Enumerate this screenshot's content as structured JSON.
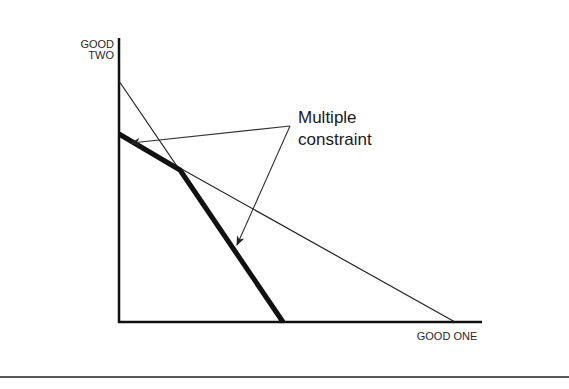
{
  "diagram": {
    "y_axis_label_line1": "GOOD",
    "y_axis_label_line2": "TWO",
    "x_axis_label": "GOOD ONE",
    "annotation_line1": "Multiple",
    "annotation_line2": "constraint",
    "colors": {
      "ink": "#111111",
      "background": "#ffffff"
    },
    "axes": {
      "origin": [
        119,
        322
      ],
      "y_top": 38,
      "x_right": 482
    },
    "constraints": [
      {
        "name": "steep constraint",
        "from": [
          119,
          81
        ],
        "to": [
          283,
          322
        ],
        "style": "thin"
      },
      {
        "name": "shallow constraint",
        "from": [
          119,
          134
        ],
        "to": [
          455,
          322
        ],
        "style": "thin"
      }
    ],
    "binding_frontier": [
      [
        119,
        134
      ],
      [
        180,
        170
      ],
      [
        283,
        322
      ]
    ],
    "arrows": [
      {
        "from": [
          290,
          126
        ],
        "to": [
          130,
          143
        ]
      },
      {
        "from": [
          290,
          126
        ],
        "to": [
          237,
          245
        ]
      }
    ]
  }
}
